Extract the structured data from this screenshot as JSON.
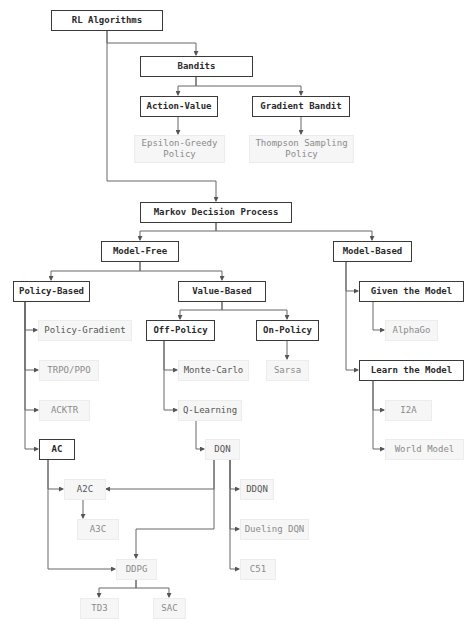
{
  "title": "RL Algorithms",
  "colors": {
    "strong_border": "#3a3a3a",
    "light_fill": "#f6f6f6",
    "light_text": "#8a8a8a",
    "edge": "#555555",
    "background": "#ffffff"
  },
  "nodes": {
    "rl_algorithms": "RL Algorithms",
    "bandits": "Bandits",
    "action_value": "Action-Value",
    "gradient_bandit": "Gradient Bandit",
    "epsilon_greedy": "Epsilon-Greedy\nPolicy",
    "thompson_sampling": "Thompson Sampling\nPolicy",
    "mdp": "Markov Decision Process",
    "model_free": "Model-Free",
    "model_based": "Model-Based",
    "policy_based": "Policy-Based",
    "value_based": "Value-Based",
    "given_the_model": "Given the Model",
    "learn_the_model": "Learn the Model",
    "off_policy": "Off-Policy",
    "on_policy": "On-Policy",
    "policy_gradient": "Policy-Gradient",
    "trpo_ppo": "TRPO/PPO",
    "acktr": "ACKTR",
    "ac": "AC",
    "monte_carlo": "Monte-Carlo",
    "q_learning": "Q-Learning",
    "sarsa": "Sarsa",
    "alphago": "AlphaGo",
    "i2a": "I2A",
    "world_model": "World Model",
    "dqn": "DQN",
    "a2c": "A2C",
    "a3c": "A3C",
    "ddqn": "DDQN",
    "dueling_dqn": "Dueling DQN",
    "c51": "C51",
    "ddpg": "DDPG",
    "td3": "TD3",
    "sac": "SAC"
  },
  "edges": [
    [
      "RL Algorithms",
      "Bandits"
    ],
    [
      "RL Algorithms",
      "Markov Decision Process"
    ],
    [
      "Bandits",
      "Action-Value"
    ],
    [
      "Bandits",
      "Gradient Bandit"
    ],
    [
      "Action-Value",
      "Epsilon-Greedy Policy"
    ],
    [
      "Gradient Bandit",
      "Thompson Sampling Policy"
    ],
    [
      "Markov Decision Process",
      "Model-Free"
    ],
    [
      "Markov Decision Process",
      "Model-Based"
    ],
    [
      "Model-Free",
      "Policy-Based"
    ],
    [
      "Model-Free",
      "Value-Based"
    ],
    [
      "Policy-Based",
      "Policy-Gradient"
    ],
    [
      "Policy-Based",
      "TRPO/PPO"
    ],
    [
      "Policy-Based",
      "ACKTR"
    ],
    [
      "Policy-Based",
      "AC"
    ],
    [
      "Value-Based",
      "Off-Policy"
    ],
    [
      "Value-Based",
      "On-Policy"
    ],
    [
      "Off-Policy",
      "Monte-Carlo"
    ],
    [
      "Off-Policy",
      "Q-Learning"
    ],
    [
      "On-Policy",
      "Sarsa"
    ],
    [
      "Q-Learning",
      "DQN"
    ],
    [
      "Model-Based",
      "Given the Model"
    ],
    [
      "Model-Based",
      "Learn the Model"
    ],
    [
      "Given the Model",
      "AlphaGo"
    ],
    [
      "Learn the Model",
      "I2A"
    ],
    [
      "Learn the Model",
      "World Model"
    ],
    [
      "AC",
      "A2C"
    ],
    [
      "AC",
      "DDPG"
    ],
    [
      "DQN",
      "A2C"
    ],
    [
      "DQN",
      "DDPG"
    ],
    [
      "DQN",
      "DDQN"
    ],
    [
      "DQN",
      "Dueling DQN"
    ],
    [
      "DQN",
      "C51"
    ],
    [
      "A2C",
      "A3C"
    ],
    [
      "DDPG",
      "TD3"
    ],
    [
      "DDPG",
      "SAC"
    ]
  ]
}
